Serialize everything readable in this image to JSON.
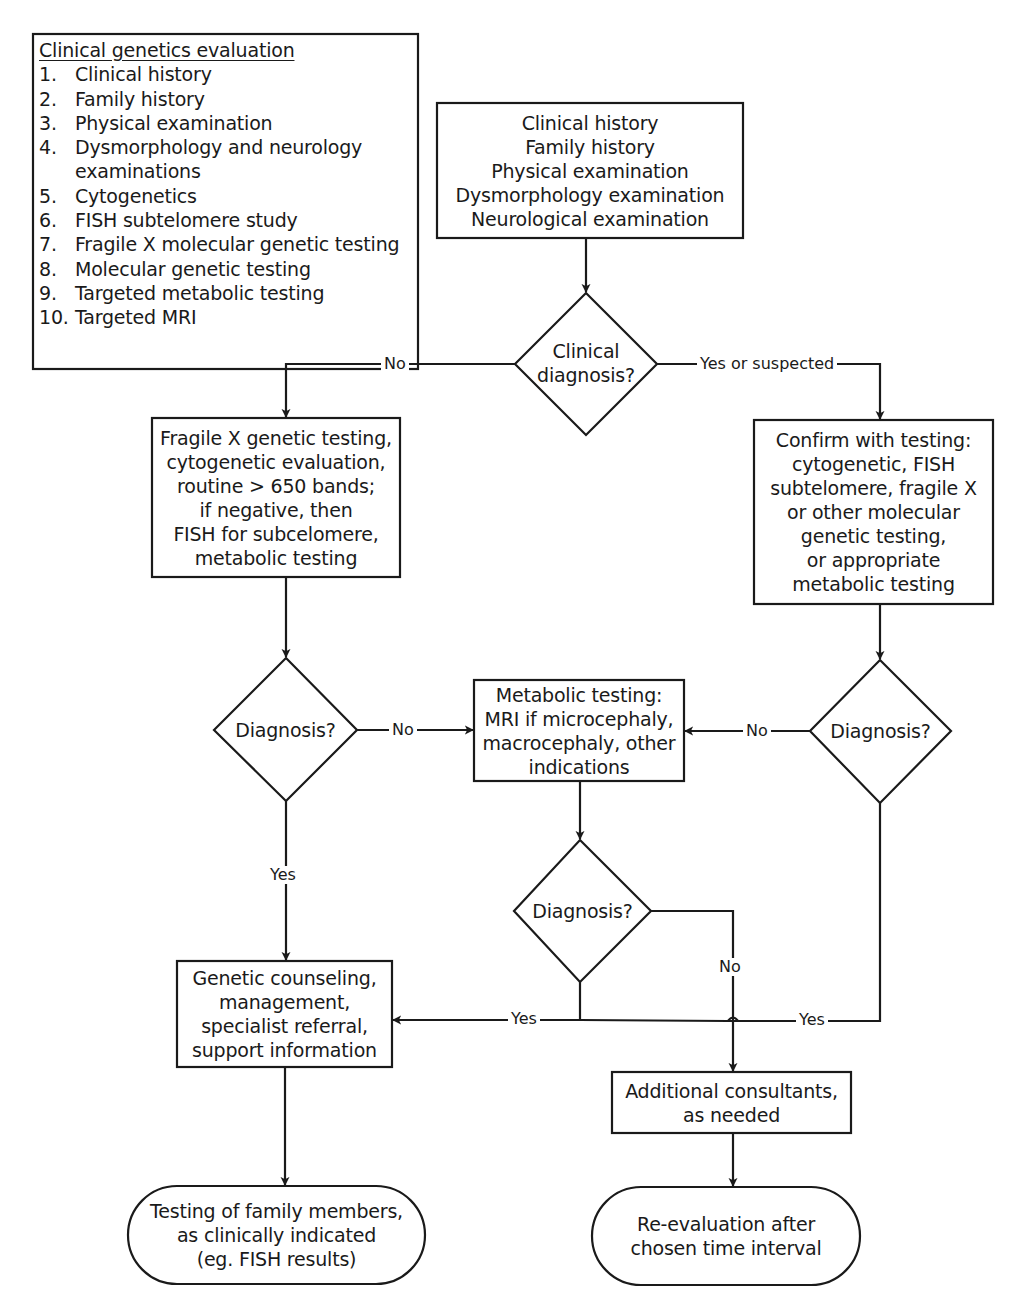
{
  "legend": {
    "title": "Clinical genetics evaluation",
    "items": [
      {
        "num": "1.",
        "text": "Clinical history"
      },
      {
        "num": "2.",
        "text": "Family history"
      },
      {
        "num": "3.",
        "text": "Physical examination"
      },
      {
        "num": "4.",
        "text": "Dysmorphology and neurology",
        "text2": "examinations"
      },
      {
        "num": "5.",
        "text": "Cytogenetics"
      },
      {
        "num": "6.",
        "text": "FISH subtelomere study"
      },
      {
        "num": "7.",
        "text": "Fragile X molecular genetic testing"
      },
      {
        "num": "8.",
        "text": "Molecular genetic testing"
      },
      {
        "num": "9.",
        "text": "Targeted metabolic testing"
      },
      {
        "num": "10.",
        "text": "Targeted MRI"
      }
    ]
  },
  "nodes": {
    "start": {
      "lines": [
        "Clinical history",
        "Family history",
        "Physical examination",
        "Dysmorphology examination",
        "Neurological examination"
      ]
    },
    "clinical_diagnosis": {
      "lines": [
        "Clinical",
        "diagnosis?"
      ]
    },
    "left_testing": {
      "lines": [
        "Fragile X genetic testing,",
        "cytogenetic evaluation,",
        "routine > 650 bands;",
        "if negative, then",
        "FISH for subcelomere,",
        "metabolic testing"
      ]
    },
    "right_confirm": {
      "lines": [
        "Confirm with testing:",
        "cytogenetic, FISH",
        "subtelomere, fragile X",
        "or other molecular",
        "genetic testing,",
        "or appropriate",
        "metabolic testing"
      ]
    },
    "left_diagnosis": {
      "lines": [
        "Diagnosis?"
      ]
    },
    "metabolic": {
      "lines": [
        "Metabolic testing:",
        "MRI if microcephaly,",
        "macrocephaly, other",
        "indications"
      ]
    },
    "right_diagnosis": {
      "lines": [
        "Diagnosis?"
      ]
    },
    "middle_diagnosis": {
      "lines": [
        "Diagnosis?"
      ]
    },
    "counseling": {
      "lines": [
        "Genetic counseling,",
        "management,",
        "specialist referral,",
        "support information"
      ]
    },
    "consultants": {
      "lines": [
        "Additional consultants,",
        "as needed"
      ]
    },
    "family_testing": {
      "lines": [
        "Testing of family members,",
        "as clinically indicated",
        "(eg. FISH results)"
      ]
    },
    "reevaluation": {
      "lines": [
        "Re-evaluation after",
        "chosen time interval"
      ]
    }
  },
  "edges": {
    "clinical_no": "No",
    "clinical_yes": "Yes or suspected",
    "left_no": "No",
    "right_no": "No",
    "left_yes": "Yes",
    "middle_no": "No",
    "middle_yes": "Yes",
    "right_yes": "Yes"
  },
  "colors": {
    "stroke": "#1a1a1a",
    "background": "#ffffff"
  }
}
